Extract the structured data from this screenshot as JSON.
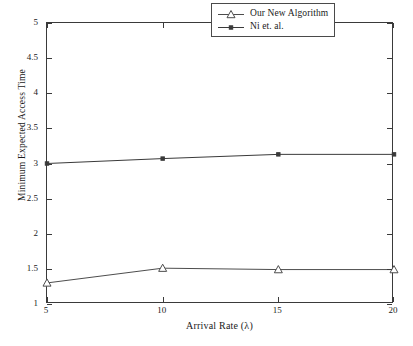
{
  "chart_data": {
    "type": "line",
    "title": "",
    "xlabel": "Arrival Rate (λ)",
    "ylabel": "Minimum Expected Access Time",
    "x": [
      5,
      10,
      15,
      20
    ],
    "xlim": [
      5,
      20
    ],
    "ylim": [
      1,
      5
    ],
    "xticks": [
      "5",
      "10",
      "15",
      "20"
    ],
    "yticks": [
      "1",
      "1.5",
      "2",
      "2.5",
      "3",
      "3.5",
      "4",
      "4.5",
      "5"
    ],
    "ytick_values": [
      1,
      1.5,
      2,
      2.5,
      3,
      3.5,
      4,
      4.5,
      5
    ],
    "grid": false,
    "legend_position": "top-right",
    "series": [
      {
        "name": "Our New Algorithm",
        "marker": "triangle-up-open",
        "color": "#4d4d4d",
        "values": [
          1.3,
          1.51,
          1.49,
          1.49
        ]
      },
      {
        "name": "Ni et. al.",
        "marker": "square-filled",
        "color": "#3a3a3a",
        "values": [
          3.0,
          3.07,
          3.13,
          3.13
        ]
      }
    ]
  },
  "legend": {
    "entries": [
      {
        "label": "Our New Algorithm"
      },
      {
        "label": "Ni et. al."
      }
    ]
  },
  "axes": {
    "x_title": "Arrival Rate (λ)",
    "y_title": "Minimum Expected Access Time"
  }
}
